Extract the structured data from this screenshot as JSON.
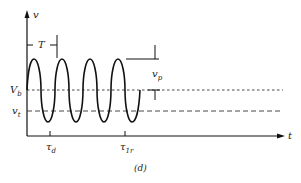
{
  "figure": {
    "panel_label": "(d)",
    "axes": {
      "y_label": "v",
      "x_label": "t"
    },
    "levels": {
      "vb_label": "V",
      "vb_sub": "b",
      "vt_label": "v",
      "vt_sub": "t"
    },
    "annotations": {
      "period": "T",
      "vp_label": "v",
      "vp_sub": "p",
      "td_label": "τ",
      "td_sub": "d",
      "t1r_label": "τ",
      "t1r_sub": "1r"
    },
    "colors": {
      "stroke": "#111111",
      "dash": "#333333",
      "background": "#ffffff"
    }
  }
}
